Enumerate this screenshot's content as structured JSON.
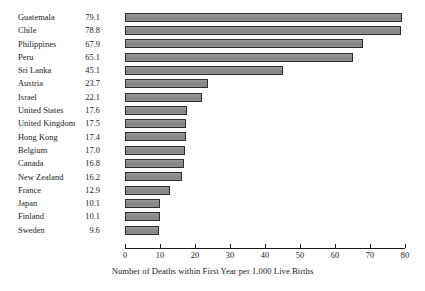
{
  "chart_data": {
    "type": "bar",
    "orientation": "horizontal",
    "title": "",
    "subtitle": "",
    "xlabel": "Number of Deaths within First Year per 1,000 Live Births",
    "ylabel": "",
    "xlim": [
      0,
      80
    ],
    "xticks": [
      0,
      10,
      20,
      30,
      40,
      50,
      60,
      70,
      80
    ],
    "xtick_labels": [
      "0",
      "10",
      "20",
      "30",
      "40",
      "50",
      "60",
      "70",
      "80"
    ],
    "grid": false,
    "legend": false,
    "bar_fill_color": "#8b8b8b",
    "bar_border_color": "#2d2d2d",
    "categories": [
      "Guatemala",
      "Chile",
      "Philippines",
      "Peru",
      "Sri Lanka",
      "Austria",
      "Israel",
      "United States",
      "United Kingdom",
      "Hong Kong",
      "Belgium",
      "Canada",
      "New Zealand",
      "France",
      "Japan",
      "Finland",
      "Sweden"
    ],
    "values": [
      79.1,
      78.8,
      67.9,
      65.1,
      45.1,
      23.7,
      22.1,
      17.6,
      17.5,
      17.4,
      17.0,
      16.8,
      16.2,
      12.9,
      10.1,
      10.1,
      9.6
    ],
    "value_labels": [
      "79.1",
      "78.8",
      "67.9",
      "65.1",
      "45.1",
      "23.7",
      "22.1",
      "17.6",
      "17.5",
      "17.4",
      "17.0",
      "16.8",
      "16.2",
      "12.9",
      "10.1",
      "10.1",
      "9.6"
    ]
  }
}
